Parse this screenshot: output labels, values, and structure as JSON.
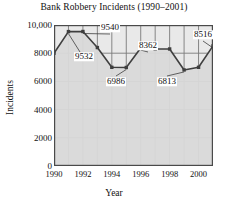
{
  "chart_data": {
    "type": "line",
    "title": "Bank Robbery Incidents (1990–2001)",
    "xlabel": "Year",
    "ylabel": "Incidents",
    "x": [
      1990,
      1991,
      1992,
      1993,
      1994,
      1995,
      1996,
      1997,
      1998,
      1999,
      2000,
      2001
    ],
    "values": [
      8000,
      9532,
      9540,
      8400,
      7000,
      6986,
      8362,
      8300,
      8300,
      6813,
      7000,
      8516
    ],
    "xlim": [
      1990,
      2001
    ],
    "ylim": [
      0,
      10000
    ],
    "ytick_labels": [
      "10,000",
      "8000",
      "6000",
      "4000",
      "2000",
      "0"
    ],
    "ytick_values": [
      10000,
      8000,
      6000,
      4000,
      2000,
      0
    ],
    "xtick_labels": [
      "1990",
      "1992",
      "1994",
      "1996",
      "1998",
      "2000"
    ],
    "xtick_values": [
      1990,
      1992,
      1994,
      1996,
      1998,
      2000
    ],
    "grid": true,
    "legend": null,
    "fill": true,
    "markers": "square",
    "annotations": [
      {
        "label": "9532",
        "x": 1991,
        "y": 9532
      },
      {
        "label": "9540",
        "x": 1992,
        "y": 9540
      },
      {
        "label": "6986",
        "x": 1995,
        "y": 6986
      },
      {
        "label": "8362",
        "x": 1996,
        "y": 8362
      },
      {
        "label": "6813",
        "x": 1999,
        "y": 6813
      },
      {
        "label": "8516",
        "x": 2001,
        "y": 8516
      }
    ],
    "colors": {
      "line": "#3f3f3f",
      "fill": "#d9d9d9",
      "grid": "#7a7a7a",
      "axis": "#4a4a4a",
      "plot_background": "#e9e9e9",
      "text": "#111111"
    }
  }
}
